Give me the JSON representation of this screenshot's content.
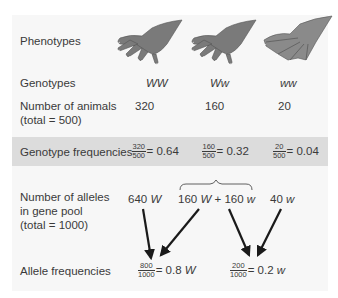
{
  "rows": {
    "phenotypes": "Phenotypes",
    "genotypes": "Genotypes",
    "animals_line1": "Number of animals",
    "animals_line2": "(total = 500)",
    "genotype_freq": "Genotype frequencies",
    "alleles_line1": "Number of alleles",
    "alleles_line2": "in gene pool",
    "alleles_line3": "(total = 1000)",
    "allele_freq": "Allele frequencies"
  },
  "columns": [
    {
      "genotype": "WW",
      "phenotype_icon": "non-webbed-foot-icon",
      "animals": "320",
      "freq_num": "320",
      "freq_den": "500",
      "freq_val": "= 0.64"
    },
    {
      "genotype": "Ww",
      "phenotype_icon": "non-webbed-foot-icon",
      "animals": "160",
      "freq_num": "160",
      "freq_den": "500",
      "freq_val": "= 0.32"
    },
    {
      "genotype": "ww",
      "phenotype_icon": "webbed-foot-icon",
      "animals": "20",
      "freq_num": "20",
      "freq_den": "500",
      "freq_val": "= 0.04"
    }
  ],
  "alleles": {
    "a1_num": "640",
    "a1_sym": "W",
    "a2_num": "160",
    "a2_sym": "W",
    "plus": "+",
    "a3_num": "160",
    "a3_sym": "w",
    "a4_num": "40",
    "a4_sym": "w"
  },
  "allele_freqs": [
    {
      "num": "800",
      "den": "1000",
      "val": "= 0.8",
      "sym": "W"
    },
    {
      "num": "200",
      "den": "1000",
      "val": "= 0.2",
      "sym": "w"
    }
  ],
  "colors": {
    "panel": "#f7f7f7",
    "band": "#dcdcdc",
    "foot": "#7a7a7a",
    "text": "#3a3a3a"
  }
}
